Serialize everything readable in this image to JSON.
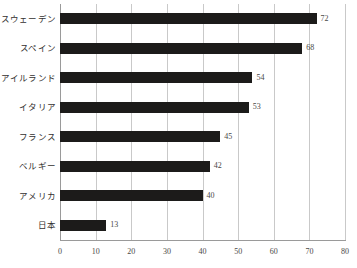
{
  "chart_data": {
    "type": "bar",
    "orientation": "horizontal",
    "title": "",
    "xlabel": "",
    "ylabel": "",
    "xlim": [
      0,
      80
    ],
    "xticks": [
      0,
      10,
      20,
      30,
      40,
      50,
      60,
      70,
      80
    ],
    "grid": true,
    "legend": false,
    "bar_color": "#1c1b1a",
    "grid_color": "#c9c9c9",
    "axis_color": "#9a9a9a",
    "label_color": "#33312f",
    "value_color": "#4a4846",
    "categories": [
      "スウェーデン",
      "スペイン",
      "アイルランド",
      "イタリア",
      "フランス",
      "ベルギー",
      "アメリカ",
      "日本"
    ],
    "values": [
      72,
      68,
      54,
      53,
      45,
      42,
      40,
      13
    ],
    "value_labels": [
      "72",
      "68",
      "54",
      "53",
      "45",
      "42",
      "40",
      "13"
    ]
  }
}
